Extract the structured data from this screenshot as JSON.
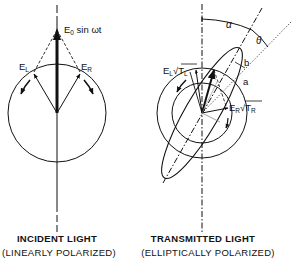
{
  "figure": {
    "left_panel": {
      "vector_label": "E₀ sin ωt",
      "vector_label_main": "E",
      "vector_label_sub": "0",
      "vector_label_rest": " sin ωt",
      "left_component": {
        "main": "E",
        "sub": "L"
      },
      "right_component": {
        "main": "E",
        "sub": "R"
      },
      "caption_line1": "INCIDENT  LIGHT",
      "caption_line2": "(LINEARLY  POLARIZED)"
    },
    "right_panel": {
      "left_component": {
        "main": "E",
        "sub": "L",
        "root": "√T",
        "root_sub": "L"
      },
      "right_component": {
        "main": "E",
        "sub": "R",
        "root": "√T",
        "root_sub": "R"
      },
      "angle_alpha": "α",
      "angle_theta": "θ",
      "minor_axis": "b",
      "major_axis": "a",
      "caption_line1": "TRANSMITTED  LIGHT",
      "caption_line2": "(ELLIPTICALLY  POLARIZED)"
    },
    "colors": {
      "ink": "#111111",
      "background": "#ffffff"
    }
  }
}
